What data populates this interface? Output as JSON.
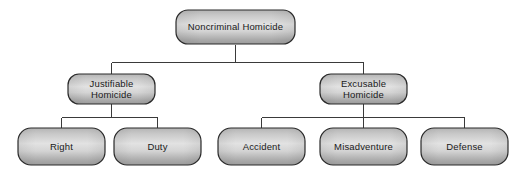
{
  "diagram": {
    "type": "hierarchy-tree",
    "colors": {
      "box_fill_top": "#b9b9b9",
      "box_fill_mid": "#dedede",
      "box_fill_bottom": "#9f9f9f",
      "box_stroke": "#2b2b2b",
      "connector_stroke": "#3a3a3a",
      "text": "#1a1a1a",
      "background": "#ffffff"
    },
    "levels": [
      {
        "level": 1,
        "nodes": [
          {
            "id": "noncriminal-homicide",
            "label": "Noncriminal Homicide",
            "lines": [
              "Noncriminal Homicide"
            ]
          }
        ]
      },
      {
        "level": 2,
        "nodes": [
          {
            "id": "justifiable-homicide",
            "label": "Justifiable Homicide",
            "lines": [
              "Justifiable",
              "Homicide"
            ]
          },
          {
            "id": "excusable-homicide",
            "label": "Excusable Homicide",
            "lines": [
              "Excusable",
              "Homicide"
            ]
          }
        ]
      },
      {
        "level": 3,
        "nodes": [
          {
            "id": "right",
            "label": "Right",
            "lines": [
              "Right"
            ]
          },
          {
            "id": "duty",
            "label": "Duty",
            "lines": [
              "Duty"
            ]
          },
          {
            "id": "accident",
            "label": "Accident",
            "lines": [
              "Accident"
            ]
          },
          {
            "id": "misadventure",
            "label": "Misadventure",
            "lines": [
              "Misadventure"
            ]
          },
          {
            "id": "defense",
            "label": "Defense",
            "lines": [
              "Defense"
            ]
          }
        ]
      }
    ],
    "edges": [
      {
        "from": "noncriminal-homicide",
        "to": "justifiable-homicide"
      },
      {
        "from": "noncriminal-homicide",
        "to": "excusable-homicide"
      },
      {
        "from": "justifiable-homicide",
        "to": "right"
      },
      {
        "from": "justifiable-homicide",
        "to": "duty"
      },
      {
        "from": "excusable-homicide",
        "to": "accident"
      },
      {
        "from": "excusable-homicide",
        "to": "misadventure"
      },
      {
        "from": "excusable-homicide",
        "to": "defense"
      }
    ],
    "labels": {
      "root": "Noncriminal Homicide",
      "justifiable_line1": "Justifiable",
      "justifiable_line2": "Homicide",
      "excusable_line1": "Excusable",
      "excusable_line2": "Homicide",
      "right": "Right",
      "duty": "Duty",
      "accident": "Accident",
      "misadventure": "Misadventure",
      "defense": "Defense"
    }
  }
}
